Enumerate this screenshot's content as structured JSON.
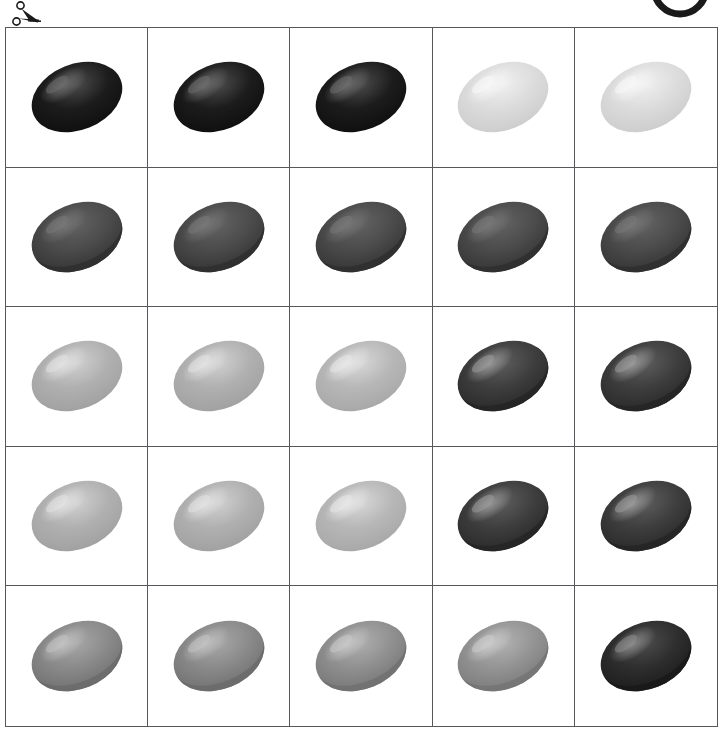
{
  "page": {
    "background_color": "#ffffff",
    "grid_line_color": "#55585c",
    "rows": 5,
    "columns": 5
  },
  "decorations": [
    {
      "name": "scissors-cut-icon",
      "label": "scissors",
      "color": "#1a1a1a"
    },
    {
      "name": "partial-circle-arc",
      "label": "arc",
      "color": "#1a1a1a"
    }
  ],
  "chart_data": {
    "type": "heatmap",
    "xlabel": "",
    "ylabel": "",
    "grid": true,
    "legend": "none",
    "categories": [
      "C1",
      "C2",
      "C3",
      "C4",
      "C5"
    ],
    "row_labels": [
      "R1",
      "R2",
      "R3",
      "R4",
      "R5"
    ],
    "values": [
      [
        10,
        10,
        10,
        86,
        86
      ],
      [
        28,
        28,
        28,
        28,
        28
      ],
      [
        69,
        69,
        72,
        24,
        24
      ],
      [
        69,
        69,
        72,
        24,
        24
      ],
      [
        54,
        54,
        56,
        58,
        18
      ]
    ],
    "cells": [
      [
        {
          "name": "blob-r1c1",
          "base": "#1c1c1c",
          "light": "#4a4a4a",
          "dark": "#0c0c0c",
          "spec": "#6e6e6e",
          "style": "A",
          "lip": false
        },
        {
          "name": "blob-r1c2",
          "base": "#1c1c1c",
          "light": "#4a4a4a",
          "dark": "#0c0c0c",
          "spec": "#6e6e6e",
          "style": "A",
          "lip": false
        },
        {
          "name": "blob-r1c3",
          "base": "#1c1c1c",
          "light": "#4a4a4a",
          "dark": "#0c0c0c",
          "spec": "#6e6e6e",
          "style": "A",
          "lip": false
        },
        {
          "name": "blob-r1c4",
          "base": "#dcdcdc",
          "light": "#efefef",
          "dark": "#c9c9c9",
          "spec": "#f7f7f7",
          "style": "A",
          "lip": false
        },
        {
          "name": "blob-r1c5",
          "base": "#dcdcdc",
          "light": "#efefef",
          "dark": "#c9c9c9",
          "spec": "#f7f7f7",
          "style": "A",
          "lip": false
        }
      ],
      [
        {
          "name": "blob-r2c1",
          "base": "#4c4c4c",
          "light": "#616161",
          "dark": "#2e2e2e",
          "spec": "#787878",
          "style": "B",
          "lip": true
        },
        {
          "name": "blob-r2c2",
          "base": "#4c4c4c",
          "light": "#616161",
          "dark": "#2e2e2e",
          "spec": "#787878",
          "style": "B",
          "lip": true
        },
        {
          "name": "blob-r2c3",
          "base": "#4c4c4c",
          "light": "#616161",
          "dark": "#2e2e2e",
          "spec": "#787878",
          "style": "B",
          "lip": true
        },
        {
          "name": "blob-r2c4",
          "base": "#4c4c4c",
          "light": "#616161",
          "dark": "#2e2e2e",
          "spec": "#787878",
          "style": "B",
          "lip": true
        },
        {
          "name": "blob-r2c5",
          "base": "#4c4c4c",
          "light": "#616161",
          "dark": "#2e2e2e",
          "spec": "#787878",
          "style": "B",
          "lip": true
        }
      ],
      [
        {
          "name": "blob-r3c1",
          "base": "#b0b0b0",
          "light": "#cfcfcf",
          "dark": "#9d9d9d",
          "spec": "#e2e2e2",
          "style": "A",
          "lip": false
        },
        {
          "name": "blob-r3c2",
          "base": "#b0b0b0",
          "light": "#cfcfcf",
          "dark": "#9d9d9d",
          "spec": "#e2e2e2",
          "style": "A",
          "lip": false
        },
        {
          "name": "blob-r3c3",
          "base": "#b7b7b7",
          "light": "#d6d6d6",
          "dark": "#a4a4a4",
          "spec": "#e8e8e8",
          "style": "A",
          "lip": false
        },
        {
          "name": "blob-r3c4",
          "base": "#3e3e3e",
          "light": "#5c5c5c",
          "dark": "#242424",
          "spec": "#9a9a9a",
          "style": "B",
          "lip": true
        },
        {
          "name": "blob-r3c5",
          "base": "#3e3e3e",
          "light": "#5c5c5c",
          "dark": "#242424",
          "spec": "#9a9a9a",
          "style": "B",
          "lip": true
        }
      ],
      [
        {
          "name": "blob-r4c1",
          "base": "#b0b0b0",
          "light": "#cfcfcf",
          "dark": "#9d9d9d",
          "spec": "#e2e2e2",
          "style": "A",
          "lip": false
        },
        {
          "name": "blob-r4c2",
          "base": "#b0b0b0",
          "light": "#cfcfcf",
          "dark": "#9d9d9d",
          "spec": "#e2e2e2",
          "style": "A",
          "lip": false
        },
        {
          "name": "blob-r4c3",
          "base": "#b7b7b7",
          "light": "#d6d6d6",
          "dark": "#a4a4a4",
          "spec": "#e8e8e8",
          "style": "A",
          "lip": false
        },
        {
          "name": "blob-r4c4",
          "base": "#3e3e3e",
          "light": "#5c5c5c",
          "dark": "#242424",
          "spec": "#9a9a9a",
          "style": "B",
          "lip": true
        },
        {
          "name": "blob-r4c5",
          "base": "#3e3e3e",
          "light": "#5c5c5c",
          "dark": "#242424",
          "spec": "#9a9a9a",
          "style": "B",
          "lip": true
        }
      ],
      [
        {
          "name": "blob-r5c1",
          "base": "#8a8a8a",
          "light": "#a6a6a6",
          "dark": "#6a6a6a",
          "spec": "#c2c2c2",
          "style": "B",
          "lip": true
        },
        {
          "name": "blob-r5c2",
          "base": "#8a8a8a",
          "light": "#a6a6a6",
          "dark": "#6a6a6a",
          "spec": "#c2c2c2",
          "style": "B",
          "lip": true
        },
        {
          "name": "blob-r5c3",
          "base": "#909090",
          "light": "#adadad",
          "dark": "#707070",
          "spec": "#c8c8c8",
          "style": "B",
          "lip": true
        },
        {
          "name": "blob-r5c4",
          "base": "#949494",
          "light": "#b1b1b1",
          "dark": "#747474",
          "spec": "#cccccc",
          "style": "B",
          "lip": true
        },
        {
          "name": "blob-r5c5",
          "base": "#2e2e2e",
          "light": "#4b4b4b",
          "dark": "#181818",
          "spec": "#8c8c8c",
          "style": "B",
          "lip": true
        }
      ]
    ]
  }
}
